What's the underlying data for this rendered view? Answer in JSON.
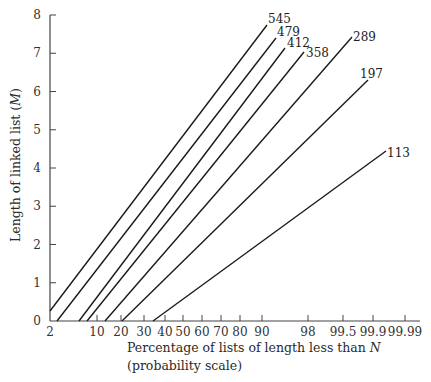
{
  "chart_data": {
    "type": "line",
    "title": "",
    "xlabel": "Percentage of lists of length less than N",
    "xlabel_line2": "(probability scale)",
    "xlabel_italic_var": "N",
    "ylabel": "Length of linked list (M)",
    "x_scale": "probability",
    "x_ticks": [
      "2",
      "10",
      "20",
      "30",
      "40",
      "50",
      "60",
      "70",
      "80",
      "90",
      "98",
      "99.5",
      "99.9",
      "99.99"
    ],
    "x_tick_values": [
      2,
      10,
      20,
      30,
      40,
      50,
      60,
      70,
      80,
      90,
      98,
      99.5,
      99.9,
      99.99
    ],
    "y_ticks": [
      "0",
      "1",
      "2",
      "3",
      "4",
      "5",
      "6",
      "7",
      "8"
    ],
    "ylim": [
      0,
      8
    ],
    "grid": false,
    "legend": "inline labels at line ends",
    "series": [
      {
        "name": "545",
        "points": [
          {
            "x": 2,
            "y": 0.26
          },
          {
            "x": 90.5,
            "y": 7.74
          }
        ]
      },
      {
        "name": "479",
        "points": [
          {
            "x": 2.7,
            "y": 0
          },
          {
            "x": 93,
            "y": 7.4
          }
        ]
      },
      {
        "name": "412",
        "points": [
          {
            "x": 6,
            "y": 0
          },
          {
            "x": 95,
            "y": 7.14
          }
        ]
      },
      {
        "name": "358",
        "points": [
          {
            "x": 8,
            "y": 0
          },
          {
            "x": 97.5,
            "y": 7.03
          }
        ]
      },
      {
        "name": "289",
        "points": [
          {
            "x": 13,
            "y": 0
          },
          {
            "x": 99.6,
            "y": 7.42
          }
        ]
      },
      {
        "name": "197",
        "points": [
          {
            "x": 20,
            "y": 0
          },
          {
            "x": 99.85,
            "y": 6.3
          }
        ]
      },
      {
        "name": "113",
        "points": [
          {
            "x": 35,
            "y": 0
          },
          {
            "x": 99.96,
            "y": 4.44
          }
        ]
      }
    ]
  },
  "layout": {
    "axis_color": "#444444",
    "line_color": "#1a1a1a",
    "x_tick_px": [
      50,
      97,
      121,
      144,
      165,
      183,
      202,
      221,
      240,
      262,
      308,
      343,
      373,
      405
    ],
    "y_zero_px": 321,
    "y_per_unit_px": 38.25,
    "series_px": [
      {
        "x1": 50,
        "y1": 311,
        "x2": 267,
        "y2": 25,
        "lx": 268,
        "ly": 23
      },
      {
        "x1": 57,
        "y1": 321,
        "x2": 276,
        "y2": 38,
        "lx": 277,
        "ly": 36
      },
      {
        "x1": 79,
        "y1": 321,
        "x2": 285,
        "y2": 48,
        "lx": 287,
        "ly": 47
      },
      {
        "x1": 87,
        "y1": 321,
        "x2": 304,
        "y2": 52,
        "lx": 306,
        "ly": 57
      },
      {
        "x1": 105,
        "y1": 321,
        "x2": 352,
        "y2": 37,
        "lx": 353,
        "ly": 41
      },
      {
        "x1": 122,
        "y1": 321,
        "x2": 368,
        "y2": 80,
        "lx": 360,
        "ly": 78
      },
      {
        "x1": 153,
        "y1": 321,
        "x2": 386,
        "y2": 151,
        "lx": 387,
        "ly": 157
      }
    ]
  }
}
